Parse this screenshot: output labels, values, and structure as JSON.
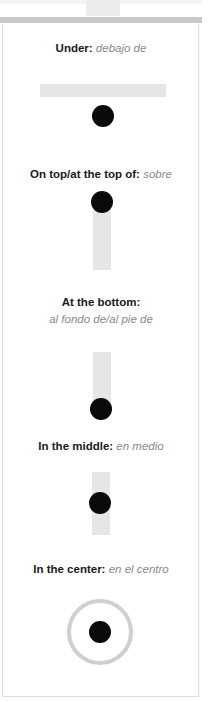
{
  "sections": [
    {
      "term": "Under:",
      "translation": "debajo de"
    },
    {
      "term": "On top/at the top of:",
      "translation": "sobre"
    },
    {
      "term": "At the bottom:",
      "translation": "al fondo de/al pie de"
    },
    {
      "term": "In the middle:",
      "translation": "en medio"
    },
    {
      "term": "In the center:",
      "translation": "en el centro"
    }
  ],
  "colors": {
    "dot": "#0a0a0a",
    "bar": "#e6e6e6",
    "ring": "#cfcfcf",
    "header_strip": "#c9c9c9",
    "translation_text": "#8a8a8a"
  }
}
